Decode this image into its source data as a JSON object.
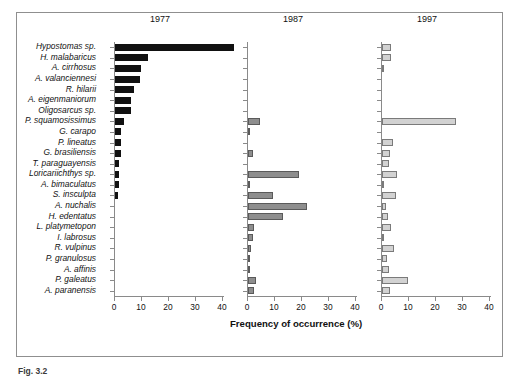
{
  "figure": {
    "caption_fragment": "Fig. 3.2",
    "axis_title": "Frequency of occurrence (%)",
    "frame_color": "#8f8f8f"
  },
  "species": [
    "Hypostomas sp.",
    "H. malabaricus",
    "A. cirrhosus",
    "A. valanciennesi",
    "R. hilarii",
    "A. eigenmaniorum",
    "Oligosarcus sp.",
    "P. squamosissimus",
    "G. carapo",
    "P. lineatus",
    "G. brasiliensis",
    "T. paraguayensis",
    "Loricariichthys sp.",
    "A. bimaculatus",
    "S. insculpta",
    "A. nuchalis",
    "H. edentatus",
    "L. platymetopon",
    "I. labrosus",
    "R. vulpinus",
    "P. granulosus",
    "A. affinis",
    "P. galeatus",
    "A. paranensis"
  ],
  "panels": [
    {
      "title": "1977",
      "key": "y1977",
      "color": "#111111",
      "edge": "#111111"
    },
    {
      "title": "1987",
      "key": "y1987",
      "color": "#8e8e8e",
      "edge": "#5a5a5a"
    },
    {
      "title": "1997",
      "key": "y1997",
      "color": "#d2d2d2",
      "edge": "#7a7a7a"
    }
  ],
  "xticks": [
    0,
    10,
    20,
    30,
    40
  ],
  "chart_data": {
    "type": "bar",
    "orientation": "horizontal",
    "title": "",
    "subtitle": "",
    "xlabel": "Frequency of occurrence (%)",
    "ylabel": "",
    "xlim": [
      0,
      45
    ],
    "xticks": [
      0,
      10,
      20,
      30,
      40
    ],
    "grid": false,
    "legend": "none",
    "panel_titles": [
      "1977",
      "1987",
      "1997"
    ],
    "categories": [
      "Hypostomas sp.",
      "H. malabaricus",
      "A. cirrhosus",
      "A. valanciennesi",
      "R. hilarii",
      "A. eigenmaniorum",
      "Oligosarcus sp.",
      "P. squamosissimus",
      "G. carapo",
      "P. lineatus",
      "G. brasiliensis",
      "T. paraguayensis",
      "Loricariichthys sp.",
      "A. bimaculatus",
      "S. insculpta",
      "A. nuchalis",
      "H. edentatus",
      "L. platymetopon",
      "I. labrosus",
      "R. vulpinus",
      "P. granulosus",
      "A. affinis",
      "P. galeatus",
      "A. paranensis"
    ],
    "series": [
      {
        "name": "1977",
        "values": [
          44.0,
          12.3,
          9.6,
          9.2,
          7.0,
          6.1,
          5.9,
          3.3,
          2.4,
          2.2,
          2.2,
          1.6,
          1.5,
          1.3,
          1.1,
          0,
          0,
          0,
          0,
          0,
          0,
          0,
          0,
          0
        ]
      },
      {
        "name": "1987",
        "values": [
          0,
          0,
          0,
          0,
          0,
          0,
          0,
          4.3,
          0.6,
          0,
          2.0,
          0,
          19.0,
          0.6,
          9.2,
          22.0,
          12.8,
          2.4,
          1.8,
          1.2,
          0.8,
          0.2,
          2.8,
          2.3
        ]
      },
      {
        "name": "1997",
        "values": [
          3.2,
          3.3,
          0.5,
          0,
          0,
          0,
          0,
          27.5,
          0,
          4.2,
          2.8,
          2.5,
          5.5,
          0.6,
          5.3,
          1.4,
          2.4,
          3.2,
          0.7,
          4.3,
          1.8,
          2.6,
          9.5,
          3.0
        ]
      }
    ]
  }
}
